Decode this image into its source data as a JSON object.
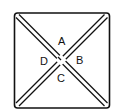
{
  "diagram": {
    "type": "square-with-crossed-double-diagonals",
    "colors": {
      "stroke": "#111111",
      "background": "#ffffff"
    },
    "regions": [
      {
        "id": "top",
        "label": "A"
      },
      {
        "id": "right",
        "label": "B"
      },
      {
        "id": "bottom",
        "label": "C"
      },
      {
        "id": "left",
        "label": "D"
      }
    ]
  }
}
